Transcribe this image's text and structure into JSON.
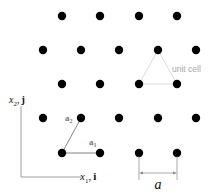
{
  "lattice": {
    "point_color": "#000000",
    "point_radius": 4.2,
    "points": [
      [
        62,
        16
      ],
      [
        100,
        16
      ],
      [
        139,
        16
      ],
      [
        177,
        16
      ],
      [
        43,
        50
      ],
      [
        81,
        50
      ],
      [
        119,
        50
      ],
      [
        158,
        50
      ],
      [
        196,
        50
      ],
      [
        62,
        84
      ],
      [
        100,
        84
      ],
      [
        139,
        84
      ],
      [
        177,
        84
      ],
      [
        43,
        118
      ],
      [
        81,
        118
      ],
      [
        119,
        118
      ],
      [
        158,
        118
      ],
      [
        196,
        118
      ],
      [
        62,
        153
      ],
      [
        100,
        153
      ],
      [
        139,
        153
      ],
      [
        177,
        153
      ]
    ]
  },
  "unit_cell": {
    "label": "unit cell",
    "color": "#dcdcdc",
    "label_color": "#a8a8a8",
    "vertices": [
      [
        139,
        84
      ],
      [
        177,
        84
      ],
      [
        158,
        50
      ]
    ]
  },
  "basis_vectors": {
    "a1": {
      "symbol": "a",
      "subscript": "1",
      "from": [
        62,
        153
      ],
      "to": [
        100,
        153
      ]
    },
    "a2": {
      "symbol": "a",
      "subscript": "2",
      "from": [
        62,
        153
      ],
      "to": [
        81,
        118
      ]
    }
  },
  "axes": {
    "x1": {
      "symbol": "x",
      "subscript": "1",
      "unit": "i"
    },
    "x2": {
      "symbol": "x",
      "subscript": "2",
      "unit": "j"
    },
    "color": "#888888"
  },
  "lattice_constant": {
    "label": "a",
    "from_x": 139,
    "to_x": 177
  }
}
